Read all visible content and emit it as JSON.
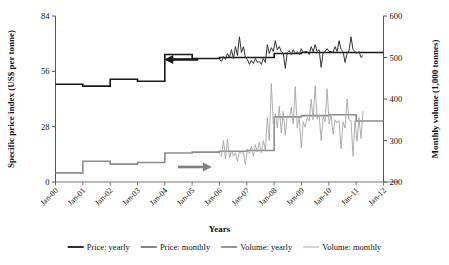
{
  "chart_data": {
    "type": "line",
    "title": "",
    "xlabel": "Years",
    "ylabel": "Specific price index (US$ per tonne)",
    "y2label": "Monthly volume (1,000 tonnes)",
    "grid": false,
    "legend_position": "bottom",
    "xlim": [
      2000,
      2012
    ],
    "ylim": [
      0,
      84
    ],
    "y2lim": [
      200,
      600
    ],
    "yticks": [
      "0",
      "28",
      "56",
      "84"
    ],
    "ytick_values": [
      0,
      28,
      56,
      84
    ],
    "y2ticks": [
      "200",
      "300",
      "400",
      "500",
      "600"
    ],
    "y2tick_values": [
      200,
      300,
      400,
      500,
      600
    ],
    "xticks": [
      "Jan-00",
      "Jan-01",
      "Jan-02",
      "Jan-03",
      "Jan-04",
      "Jan-05",
      "Jan-06",
      "Jan-07",
      "Jan-08",
      "Jan-09",
      "Jan-10",
      "Jan-11",
      "Jan-12"
    ],
    "xtick_values": [
      2000,
      2001,
      2002,
      2003,
      2004,
      2005,
      2006,
      2007,
      2008,
      2009,
      2010,
      2011,
      2012
    ],
    "annotations": [
      {
        "name": "left-axis-arrow",
        "text": "",
        "symbol": "arrow-left",
        "color": "#1a1a1a",
        "x": 2004.6,
        "y": 62
      },
      {
        "name": "right-axis-arrow",
        "text": "",
        "symbol": "arrow-right",
        "color": "#808080",
        "x": 2005.1,
        "y": 11
      }
    ],
    "series": [
      {
        "name": "Price: yearly",
        "axis": "left",
        "style": "step",
        "color": "#1a1a1a",
        "width": 1.6,
        "x": [
          2000,
          2001,
          2002,
          2003,
          2004,
          2005,
          2006,
          2007,
          2008,
          2009,
          2010,
          2011
        ],
        "values": [
          49.5,
          48.5,
          52.0,
          51.0,
          64.5,
          62.5,
          63.0,
          63.0,
          65.0,
          65.5,
          65.5,
          65.5
        ]
      },
      {
        "name": "Price: monthly",
        "axis": "left",
        "style": "line",
        "color": "#333333",
        "width": 1.0,
        "x_start": 2006.0,
        "x_end": 2011.25,
        "values": [
          62.0,
          61.0,
          63.5,
          62.0,
          65.0,
          63.0,
          67.0,
          62.5,
          68.5,
          64.0,
          73.5,
          65.5,
          68.5,
          63.0,
          62.0,
          59.5,
          61.5,
          60.0,
          62.5,
          60.5,
          61.0,
          59.5,
          62.5,
          60.5,
          69.5,
          65.0,
          68.0,
          66.0,
          71.5,
          67.0,
          68.5,
          66.0,
          65.0,
          57.5,
          65.5,
          66.5,
          64.5,
          67.0,
          65.0,
          66.0,
          64.5,
          67.5,
          65.5,
          66.0,
          66.0,
          64.5,
          68.5,
          66.0,
          69.5,
          66.0,
          67.0,
          58.0,
          65.5,
          66.0,
          67.5,
          66.0,
          66.0,
          65.5,
          68.5,
          66.0,
          71.5,
          67.0,
          66.0,
          60.5,
          65.0,
          66.5,
          73.5,
          67.0,
          66.0,
          65.0,
          66.0,
          63.0,
          64.0
        ]
      },
      {
        "name": "Volume: yearly",
        "axis": "right",
        "style": "step",
        "color": "#8c8c8c",
        "width": 1.6,
        "x": [
          2000,
          2001,
          2002,
          2003,
          2004,
          2005,
          2006,
          2007,
          2008,
          2009,
          2010,
          2011
        ],
        "values": [
          222,
          250,
          243,
          247,
          270,
          272,
          274,
          276,
          357,
          360,
          362,
          347
        ]
      },
      {
        "name": "Volume: monthly",
        "axis": "right",
        "style": "line",
        "color": "#a6a6a6",
        "width": 0.9,
        "x_start": 2006.0,
        "x_end": 2011.25,
        "values": [
          268,
          262,
          300,
          255,
          303,
          258,
          275,
          262,
          270,
          250,
          273,
          268,
          272,
          242,
          280,
          268,
          286,
          262,
          290,
          272,
          295,
          270,
          300,
          276,
          355,
          300,
          437,
          340,
          365,
          330,
          382,
          318,
          370,
          312,
          360,
          355,
          380,
          340,
          430,
          330,
          358,
          282,
          345,
          332,
          356,
          347,
          400,
          350,
          432,
          352,
          362,
          300,
          358,
          345,
          425,
          340,
          360,
          315,
          350,
          342,
          348,
          280,
          345,
          330,
          400,
          350,
          348,
          262,
          348,
          298,
          355,
          305,
          370
        ]
      }
    ]
  },
  "legend": {
    "items": [
      {
        "label": "Price: yearly",
        "color": "#1a1a1a",
        "width": 1.8
      },
      {
        "label": "Price: monthly",
        "color": "#333333",
        "width": 1.2
      },
      {
        "label": "Volume: yearly",
        "color": "#8c8c8c",
        "width": 1.8
      },
      {
        "label": "Volume: monthly",
        "color": "#a6a6a6",
        "width": 1.0
      }
    ]
  },
  "colors": {
    "price_yearly": "#1a1a1a",
    "price_monthly": "#333333",
    "volume_yearly": "#8c8c8c",
    "volume_monthly": "#a6a6a6",
    "axis": "#555555",
    "text": "#111111",
    "background": "#ffffff"
  }
}
